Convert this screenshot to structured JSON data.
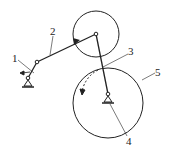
{
  "diagram": {
    "type": "mechanism",
    "labels": {
      "l1": "1",
      "l2": "2",
      "l3": "3",
      "l4": "4",
      "l5": "5"
    },
    "colors": {
      "stroke": "#222222",
      "background": "#ffffff"
    }
  }
}
